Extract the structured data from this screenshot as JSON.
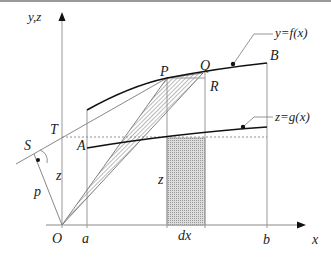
{
  "diagram": {
    "axes": {
      "y_label": "y,z",
      "x_label": "x",
      "origin_label": "O"
    },
    "points": {
      "S": "S",
      "T": "T",
      "A": "A",
      "P": "P",
      "Q": "Q",
      "R": "R",
      "B": "B"
    },
    "tick_labels": {
      "a": "a",
      "dx": "dx",
      "b": "b"
    },
    "segment_labels": {
      "p": "p",
      "z_left": "z",
      "z_strip": "z"
    },
    "curve_labels": {
      "f": "y=f(x)",
      "g": "z=g(x)"
    },
    "colors": {
      "axis": "#aaaaaa",
      "curve": "#111111",
      "thin_line": "#999999",
      "hatch": "#888888"
    }
  }
}
